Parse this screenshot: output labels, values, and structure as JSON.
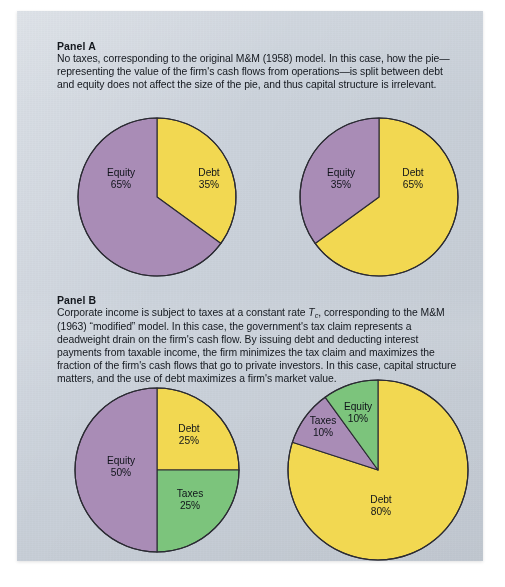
{
  "figure": {
    "background_color": "#ccd3dc",
    "palette": {
      "equity": "#a98cb6",
      "debt": "#f2d851",
      "taxes": "#7cc47c",
      "outline": "#2b2b33",
      "text": "#14181e"
    }
  },
  "panels": [
    {
      "id": "panel-a",
      "title": "Panel A",
      "body": "No taxes, corresponding to the original M&M (1958) model. In this case, how the pie—representing the value of the firm's cash flows from operations—is split between debt and equity does not affect the size of the pie, and thus capital structure is irrelevant."
    },
    {
      "id": "panel-b",
      "title": "Panel B",
      "body_part1": "Corporate income is subject to taxes at a constant rate ",
      "body_italic": "T",
      "body_subscript": "c",
      "body_part2": ", corresponding to the M&M (1963) “modified” model. In this case, the government's tax claim represents a deadweight drain on the firm's cash flow. By issuing debt and deducting interest payments from taxable income, the firm minimizes the tax claim and maximizes the fraction of the firm's cash flows that go to private investors. In this case, capital structure matters, and the use of debt maximizes a firm's market value."
    }
  ],
  "chart_data": [
    {
      "type": "pie",
      "id": "pie-a-left",
      "panel": "Panel A",
      "title": "",
      "start_angle_deg": 0,
      "direction": "clockwise",
      "categories": [
        "Debt",
        "Equity"
      ],
      "values": [
        35,
        65
      ],
      "labels": [
        "Debt\n35%",
        "Equity\n65%"
      ],
      "colors": [
        "#f2d851",
        "#a98cb6"
      ],
      "slices": [
        {
          "name": "Debt",
          "value": 35,
          "value_text": "35%",
          "color": "#f2d851",
          "label_x": 52,
          "label_y": -18
        },
        {
          "name": "Equity",
          "value": 65,
          "value_text": "65%",
          "color": "#a98cb6",
          "label_x": -36,
          "label_y": -18
        }
      ]
    },
    {
      "type": "pie",
      "id": "pie-a-right",
      "panel": "Panel A",
      "title": "",
      "start_angle_deg": 0,
      "direction": "clockwise",
      "categories": [
        "Debt",
        "Equity"
      ],
      "values": [
        65,
        35
      ],
      "labels": [
        "Debt\n65%",
        "Equity\n35%"
      ],
      "colors": [
        "#f2d851",
        "#a98cb6"
      ],
      "slices": [
        {
          "name": "Debt",
          "value": 65,
          "value_text": "65%",
          "color": "#f2d851",
          "label_x": 34,
          "label_y": -18
        },
        {
          "name": "Equity",
          "value": 35,
          "value_text": "35%",
          "color": "#a98cb6",
          "label_x": -38,
          "label_y": -18
        }
      ]
    },
    {
      "type": "pie",
      "id": "pie-b-left",
      "panel": "Panel B",
      "title": "",
      "start_angle_deg": 0,
      "direction": "clockwise",
      "categories": [
        "Debt",
        "Taxes",
        "Equity"
      ],
      "values": [
        25,
        25,
        50
      ],
      "labels": [
        "Debt\n25%",
        "Taxes\n25%",
        "Equity\n50%"
      ],
      "colors": [
        "#f2d851",
        "#7cc47c",
        "#a98cb6"
      ],
      "slices": [
        {
          "name": "Debt",
          "value": 25,
          "value_text": "25%",
          "color": "#f2d851",
          "label_x": 32,
          "label_y": -35
        },
        {
          "name": "Taxes",
          "value": 25,
          "value_text": "25%",
          "color": "#7cc47c",
          "label_x": 33,
          "label_y": 30
        },
        {
          "name": "Equity",
          "value": 50,
          "value_text": "50%",
          "color": "#a98cb6",
          "label_x": -36,
          "label_y": -3
        }
      ]
    },
    {
      "type": "pie",
      "id": "pie-b-right",
      "panel": "Panel B",
      "title": "",
      "start_angle_deg": 0,
      "direction": "clockwise",
      "categories": [
        "Debt",
        "Equity",
        "Taxes"
      ],
      "values": [
        80,
        10,
        10
      ],
      "labels": [
        "Debt\n80%",
        "Equity\n10%",
        "Taxes\n10%"
      ],
      "colors": [
        "#f2d851",
        "#a98cb6",
        "#7cc47c"
      ],
      "slices": [
        {
          "name": "Debt",
          "value": 80,
          "value_text": "80%",
          "color": "#f2d851",
          "label_x": 3,
          "label_y": 36
        },
        {
          "name": "Equity",
          "value": 10,
          "value_text": "10%",
          "color": "#a98cb6",
          "label_x": -20,
          "label_y": -57
        },
        {
          "name": "Taxes",
          "value": 10,
          "value_text": "10%",
          "color": "#7cc47c",
          "label_x": -55,
          "label_y": -43
        }
      ]
    }
  ]
}
